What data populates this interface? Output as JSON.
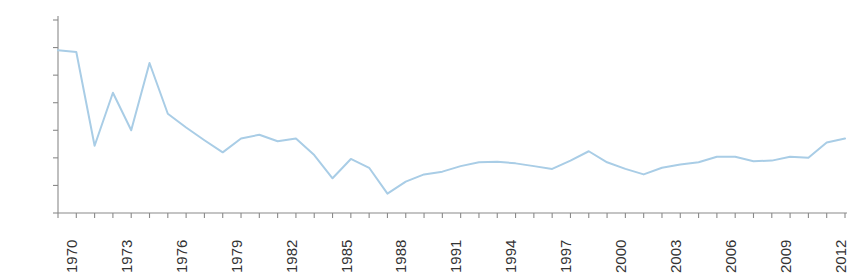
{
  "chart_data": {
    "type": "line",
    "title": "",
    "xlabel": "",
    "ylabel": "",
    "ylim": [
      -0.5,
      3.0
    ],
    "xlim": [
      1970,
      2013
    ],
    "grid": false,
    "legend": null,
    "y_tick_labels": [
      "3,0%",
      "2,5%",
      "2,0%",
      "1,5%",
      "1,0%",
      "0,5%",
      "0,0%",
      "-0,5%"
    ],
    "y_tick_values": [
      3.0,
      2.5,
      2.0,
      1.5,
      1.0,
      0.5,
      0.0,
      -0.5
    ],
    "x_tick_labels": [
      "1970",
      "1973",
      "1976",
      "1979",
      "1982",
      "1985",
      "1988",
      "1991",
      "1994",
      "1997",
      "2000",
      "2003",
      "2006",
      "2009",
      "2012"
    ],
    "x_tick_values": [
      1970,
      1973,
      1976,
      1979,
      1982,
      1985,
      1988,
      1991,
      1994,
      1997,
      2000,
      2003,
      2006,
      2009,
      2012
    ],
    "x": [
      1970,
      1971,
      1972,
      1973,
      1974,
      1975,
      1976,
      1977,
      1978,
      1979,
      1980,
      1981,
      1982,
      1983,
      1984,
      1985,
      1986,
      1987,
      1988,
      1989,
      1990,
      1991,
      1992,
      1993,
      1994,
      1995,
      1996,
      1997,
      1998,
      1999,
      2000,
      2001,
      2002,
      2003,
      2004,
      2005,
      2006,
      2007,
      2008,
      2009,
      2010,
      2011,
      2012,
      2013
    ],
    "series": [
      {
        "name": "",
        "color": "#a9cde6",
        "values": [
          2.45,
          2.42,
          0.72,
          1.68,
          1.0,
          2.22,
          1.3,
          1.05,
          0.82,
          0.6,
          0.85,
          0.92,
          0.8,
          0.85,
          0.55,
          0.13,
          0.48,
          0.32,
          -0.15,
          0.07,
          0.2,
          0.25,
          0.35,
          0.42,
          0.43,
          0.4,
          0.35,
          0.3,
          0.45,
          0.62,
          0.42,
          0.3,
          0.2,
          0.32,
          0.38,
          0.42,
          0.52,
          0.52,
          0.44,
          0.45,
          0.52,
          0.5,
          0.78,
          0.85
        ]
      }
    ],
    "plot_geometry": {
      "left_px": 58,
      "right_px": 845,
      "top_px": 20,
      "bottom_px": 213,
      "axis_color": "#8a8a8a",
      "line_width": 2.0
    }
  }
}
